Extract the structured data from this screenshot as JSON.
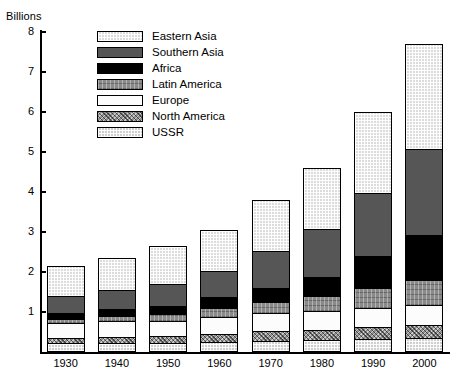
{
  "axis": {
    "y_title": "Billions",
    "y_ticks": [
      "1",
      "2",
      "3",
      "4",
      "5",
      "6",
      "7",
      "8"
    ],
    "x_ticks": [
      "1930",
      "1940",
      "1950",
      "1960",
      "1970",
      "1980",
      "1990",
      "2000"
    ]
  },
  "legend": {
    "items": [
      {
        "label": "Eastern Asia",
        "key": "eastern-asia",
        "swatch": "light-dotted"
      },
      {
        "label": "Southern Asia",
        "key": "southern-asia",
        "swatch": "dark-gray-solid"
      },
      {
        "label": "Africa",
        "key": "africa",
        "swatch": "black-solid"
      },
      {
        "label": "Latin America",
        "key": "latin-america",
        "swatch": "medium-gray-textured"
      },
      {
        "label": "Europe",
        "key": "europe",
        "swatch": "white"
      },
      {
        "label": "North America",
        "key": "north-america",
        "swatch": "gray-crosshatch"
      },
      {
        "label": "USSR",
        "key": "ussr",
        "swatch": "light-stipple"
      }
    ]
  },
  "chart_data": {
    "type": "bar",
    "stacked": true,
    "title": "",
    "xlabel": "",
    "ylabel": "Billions",
    "ylim": [
      0,
      8
    ],
    "ytick_step": 1,
    "grid": false,
    "legend_position": "top-left-inside",
    "categories": [
      "1930",
      "1940",
      "1950",
      "1960",
      "1970",
      "1980",
      "1990",
      "2000"
    ],
    "stack_order_bottom_to_top": [
      "USSR",
      "North America",
      "Europe",
      "Latin America",
      "Africa",
      "Southern Asia",
      "Eastern Asia"
    ],
    "series": [
      {
        "name": "USSR",
        "color": "#cfcfcf",
        "values": [
          0.18,
          0.19,
          0.18,
          0.21,
          0.24,
          0.26,
          0.29,
          0.31
        ]
      },
      {
        "name": "North America",
        "color": "#909090",
        "values": [
          0.14,
          0.15,
          0.17,
          0.2,
          0.23,
          0.25,
          0.28,
          0.31
        ]
      },
      {
        "name": "Europe",
        "color": "#fcfcfc",
        "values": [
          0.36,
          0.39,
          0.4,
          0.43,
          0.46,
          0.48,
          0.5,
          0.51
        ]
      },
      {
        "name": "Latin America",
        "color": "#8a8a8a",
        "values": [
          0.11,
          0.13,
          0.16,
          0.22,
          0.29,
          0.37,
          0.5,
          0.62
        ]
      },
      {
        "name": "Africa",
        "color": "#000000",
        "values": [
          0.16,
          0.18,
          0.22,
          0.28,
          0.36,
          0.48,
          0.79,
          1.15
        ]
      },
      {
        "name": "Southern Asia",
        "color": "#565656",
        "values": [
          0.43,
          0.48,
          0.56,
          0.67,
          0.92,
          1.21,
          1.6,
          2.15
        ]
      },
      {
        "name": "Eastern Asia",
        "color": "#dcdcdc",
        "values": [
          0.77,
          0.83,
          0.96,
          1.04,
          1.3,
          1.55,
          2.04,
          2.65
        ]
      }
    ],
    "totals": [
      2.15,
      2.35,
      2.65,
      3.05,
      3.9,
      4.6,
      6.0,
      7.7
    ]
  }
}
